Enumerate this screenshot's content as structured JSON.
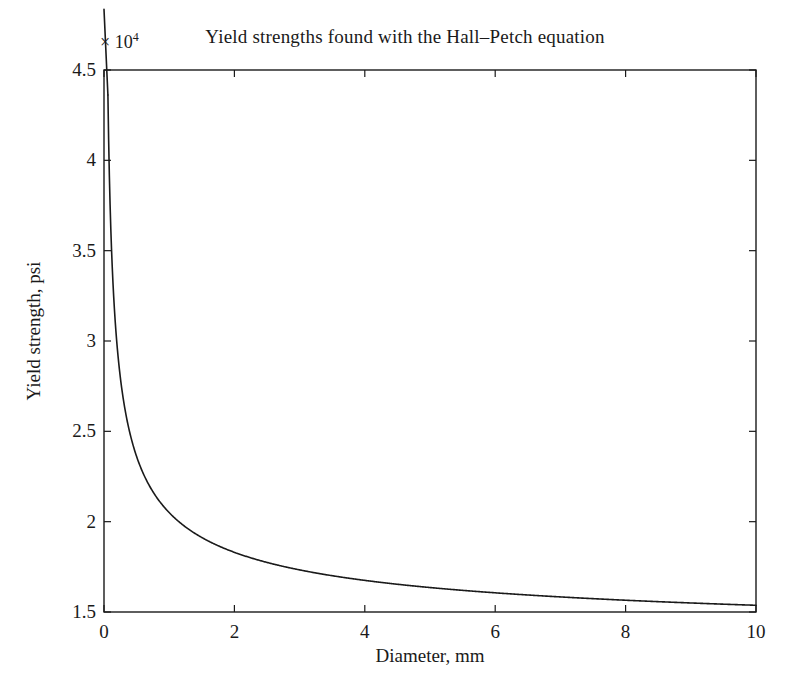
{
  "chart_data": {
    "type": "line",
    "title": "Yield strengths found with the Hall–Petch equation",
    "xlabel": "Diameter, mm",
    "ylabel": "Yield strength, psi",
    "y_exponent_label": "× 10",
    "y_exponent_sup": "4",
    "y_scale_factor": 10000,
    "xlim": [
      0,
      10
    ],
    "ylim": [
      15000,
      45000
    ],
    "xticks": [
      0,
      2,
      4,
      6,
      8,
      10
    ],
    "xtick_labels": [
      "0",
      "2",
      "4",
      "6",
      "8",
      "10"
    ],
    "yticks": [
      15000,
      20000,
      25000,
      30000,
      35000,
      40000,
      45000
    ],
    "ytick_labels": [
      "1.5",
      "2",
      "2.5",
      "3",
      "3.5",
      "4",
      "4.5"
    ],
    "grid": false,
    "legend": false,
    "line_color": "#1a1a1a",
    "line_width": 1.6,
    "equation": "sigma = sigma0 + k / sqrt(d)",
    "sigma0": 13000,
    "k": 7500,
    "series": [
      {
        "name": "Hall-Petch yield strength",
        "x": [
          0.06,
          0.1,
          0.15,
          0.2,
          0.3,
          0.4,
          0.5,
          0.6,
          0.7,
          0.8,
          0.9,
          1.0,
          1.2,
          1.4,
          1.6,
          1.8,
          2.0,
          2.25,
          2.5,
          2.75,
          3.0,
          3.5,
          4.0,
          4.5,
          5.0,
          5.5,
          6.0,
          6.5,
          7.0,
          7.5,
          8.0,
          8.5,
          9.0,
          9.5,
          10.0
        ],
        "y": [
          43620,
          36720,
          32366,
          29771,
          26693,
          24858,
          23607,
          22683,
          21964,
          21385,
          20906,
          20500,
          19847,
          19339,
          18929,
          18589,
          18303,
          18000,
          17744,
          17523,
          17330,
          17009,
          16750,
          16536,
          16354,
          16198,
          16062,
          15942,
          15835,
          15739,
          15652,
          15573,
          15500,
          15434,
          15372
        ]
      }
    ],
    "plot_box": {
      "left_px": 104,
      "right_px": 756,
      "top_px": 70,
      "bottom_px": 612
    }
  }
}
